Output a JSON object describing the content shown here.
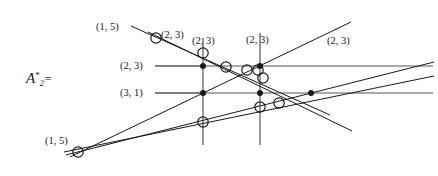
{
  "figure": {
    "symbol": {
      "name": "script-A",
      "letter": "A",
      "subscript": "2",
      "superscript": "*",
      "equals": "="
    },
    "stroke_color": "#1a1a1a",
    "grid_line_color": "#555555",
    "background": "#ffffff",
    "width": 438,
    "height": 176
  },
  "chart_data": {
    "type": "scatter",
    "title": "",
    "xlabel": "",
    "ylabel": "",
    "xlim": [
      0,
      438
    ],
    "ylim": [
      176,
      0
    ],
    "grid": false,
    "legend": null,
    "annotations": [
      {
        "id": "lbl-1-5-top",
        "text": "(1, 5)",
        "x": 96,
        "y": 22
      },
      {
        "id": "lbl-2-3-a",
        "text": "(2, 3)",
        "x": 161,
        "y": 30
      },
      {
        "id": "lbl-2-3-b",
        "text": "(2, 3)",
        "x": 192,
        "y": 36
      },
      {
        "id": "lbl-2-3-c",
        "text": "(2, 3)",
        "x": 246,
        "y": 35
      },
      {
        "id": "lbl-2-3-d",
        "text": "(2, 3)",
        "x": 327,
        "y": 36
      },
      {
        "id": "lbl-2-3-left",
        "text": "(2, 3)",
        "x": 120,
        "y": 61
      },
      {
        "id": "lbl-3-1-left",
        "text": "(3, 1)",
        "x": 120,
        "y": 88
      },
      {
        "id": "lbl-1-5-bottom",
        "text": "(1, 5)",
        "x": 45,
        "y": 136
      }
    ],
    "leader_lines": [
      {
        "id": "leader-2-3",
        "x1": 155,
        "y1": 66,
        "x2": 203,
        "y2": 66
      },
      {
        "id": "leader-3-1",
        "x1": 155,
        "y1": 93,
        "x2": 203,
        "y2": 93
      }
    ],
    "horizontal_lines": [
      {
        "id": "h-upper",
        "y": 66,
        "x1": 155,
        "x2": 433
      },
      {
        "id": "h-lower",
        "y": 93,
        "x1": 155,
        "x2": 433
      }
    ],
    "vertical_lines": [
      {
        "id": "v-left",
        "x": 203,
        "y1": 38,
        "y2": 145
      },
      {
        "id": "v-right",
        "x": 260,
        "y1": 33,
        "y2": 145
      }
    ],
    "diagonal_lines": [
      {
        "id": "d-1",
        "x1": 131,
        "y1": 26,
        "x2": 330,
        "y2": 115
      },
      {
        "id": "d-2",
        "x1": 148,
        "y1": 32,
        "x2": 352,
        "y2": 131
      },
      {
        "id": "d-3",
        "x1": 70,
        "y1": 157,
        "x2": 351,
        "y2": 22
      },
      {
        "id": "d-4",
        "x1": 66,
        "y1": 155,
        "x2": 434,
        "y2": 62
      },
      {
        "id": "d-5",
        "x1": 64,
        "y1": 152,
        "x2": 434,
        "y2": 76
      }
    ],
    "filled_points": [
      {
        "id": "p-1",
        "x": 203,
        "y": 66
      },
      {
        "id": "p-2",
        "x": 203,
        "y": 93
      },
      {
        "id": "p-3",
        "x": 260,
        "y": 66
      },
      {
        "id": "p-4",
        "x": 260,
        "y": 93
      },
      {
        "id": "p-5",
        "x": 311,
        "y": 93
      }
    ],
    "open_points": [
      {
        "id": "c-1",
        "x": 156,
        "y": 38
      },
      {
        "id": "c-2",
        "x": 203,
        "y": 53
      },
      {
        "id": "c-3",
        "x": 226,
        "y": 67
      },
      {
        "id": "c-4",
        "x": 247,
        "y": 70
      },
      {
        "id": "c-5",
        "x": 258,
        "y": 70
      },
      {
        "id": "c-6",
        "x": 263,
        "y": 78
      },
      {
        "id": "c-7",
        "x": 260,
        "y": 107
      },
      {
        "id": "c-8",
        "x": 279,
        "y": 103
      },
      {
        "id": "c-9",
        "x": 203,
        "y": 122
      },
      {
        "id": "c-10",
        "x": 78,
        "y": 152
      }
    ]
  }
}
